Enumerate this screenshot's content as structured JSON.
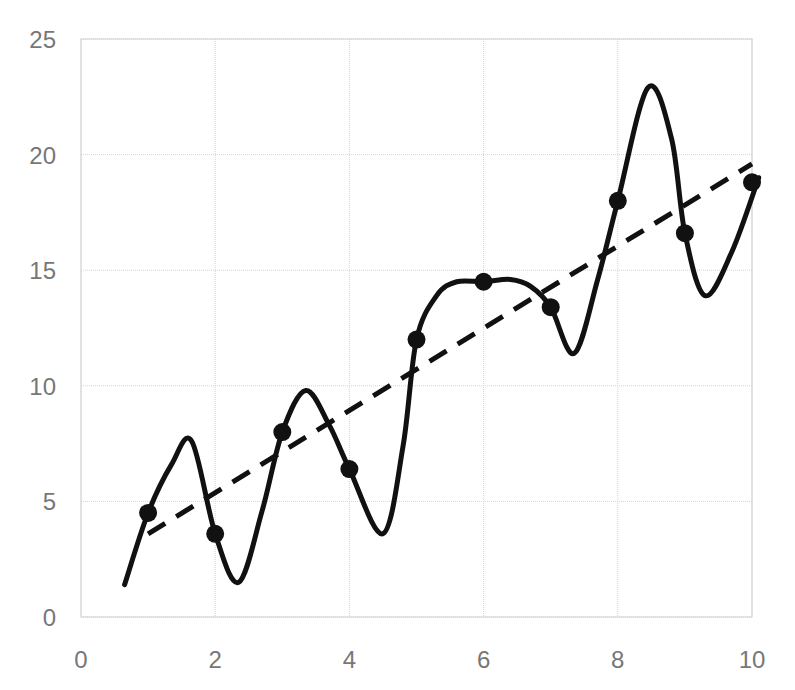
{
  "chart_data": {
    "type": "scatter",
    "title": "",
    "xlabel": "",
    "ylabel": "",
    "xlim": [
      0,
      10
    ],
    "ylim": [
      0,
      25
    ],
    "grid": true,
    "legend": null,
    "x_ticks": [
      "0",
      "2",
      "4",
      "6",
      "8",
      "10"
    ],
    "y_ticks": [
      "0",
      "5",
      "10",
      "15",
      "20",
      "25"
    ],
    "series": [
      {
        "name": "data points",
        "kind": "scatter",
        "marker": "filled-circle",
        "color": "#000000",
        "x": [
          1,
          2,
          3,
          4,
          5,
          6,
          7,
          8,
          9,
          10
        ],
        "y": [
          4.5,
          3.6,
          8.0,
          6.4,
          12.0,
          14.5,
          13.4,
          18.0,
          16.6,
          18.8
        ]
      },
      {
        "name": "interpolating curve",
        "kind": "line",
        "style": "solid",
        "color": "#000000",
        "x": [
          0.65,
          1.0,
          1.35,
          1.65,
          2.0,
          2.35,
          2.7,
          3.0,
          3.35,
          3.7,
          4.0,
          4.5,
          4.8,
          5.0,
          5.3,
          5.6,
          6.0,
          6.4,
          6.7,
          7.0,
          7.35,
          7.7,
          8.0,
          8.45,
          8.8,
          9.0,
          9.3,
          9.7,
          10.1
        ],
        "y": [
          1.4,
          4.5,
          6.6,
          7.6,
          3.6,
          1.5,
          4.6,
          8.0,
          9.8,
          8.3,
          6.4,
          3.6,
          7.4,
          12.0,
          13.9,
          14.5,
          14.5,
          14.6,
          14.3,
          13.4,
          11.4,
          14.6,
          18.0,
          22.9,
          20.7,
          16.6,
          13.9,
          15.8,
          19.0
        ]
      },
      {
        "name": "linear fit",
        "kind": "line",
        "style": "dashed",
        "color": "#000000",
        "x": [
          1,
          10
        ],
        "y": [
          3.6,
          19.6
        ]
      }
    ]
  },
  "axes": {
    "x_ticks": [
      "0",
      "2",
      "4",
      "6",
      "8",
      "10"
    ],
    "y_ticks": [
      "0",
      "5",
      "10",
      "15",
      "20",
      "25"
    ]
  }
}
